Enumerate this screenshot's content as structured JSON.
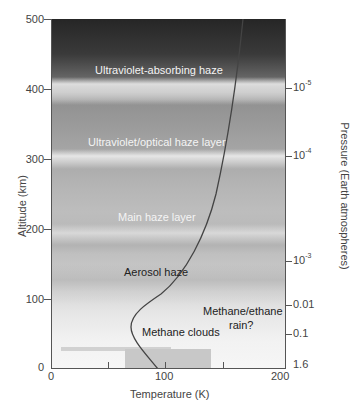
{
  "diagram": {
    "x_axis": {
      "label": "Temperature (K)",
      "ticks": [
        "0",
        "100",
        "200"
      ],
      "range": [
        0,
        200
      ]
    },
    "y_axis_left": {
      "label": "Altitude (km)",
      "ticks": [
        "0",
        "100",
        "200",
        "300",
        "400",
        "500"
      ],
      "range": [
        0,
        500
      ]
    },
    "y_axis_right": {
      "label": "Pressure (Earth atmospheres)",
      "ticks": [
        {
          "base": "10",
          "exp": "-5",
          "altitude_km": 400
        },
        {
          "base": "10",
          "exp": "-4",
          "altitude_km": 300
        },
        {
          "base": "10",
          "exp": "-3",
          "altitude_km": 150
        },
        {
          "text": "0.01",
          "altitude_km": 95
        },
        {
          "text": "0.1",
          "altitude_km": 45
        },
        {
          "text": "1.6",
          "altitude_km": 0
        }
      ]
    },
    "layers": [
      {
        "label": "Ultraviolet-absorbing haze",
        "altitude_km": 420
      },
      {
        "label": "Ultraviolet/optical haze layer",
        "altitude_km": 320
      },
      {
        "label": "Main haze layer",
        "altitude_km": 215
      },
      {
        "label": "Aerosol haze",
        "altitude_km": 140
      },
      {
        "label": "Methane clouds",
        "altitude_km": 50
      },
      {
        "label_line1": "Methane/ethane",
        "label_line2": "rain?",
        "altitude_km": 60
      }
    ],
    "temperature_profile": {
      "points_K_km": [
        [
          94,
          0
        ],
        [
          80,
          30
        ],
        [
          72,
          60
        ],
        [
          78,
          85
        ],
        [
          95,
          110
        ],
        [
          115,
          140
        ],
        [
          135,
          180
        ],
        [
          150,
          230
        ],
        [
          160,
          290
        ],
        [
          165,
          350
        ],
        [
          168,
          420
        ],
        [
          170,
          500
        ]
      ]
    },
    "colors": {
      "sky_top": "#262626",
      "sky_bottom": "#f6f6f6",
      "curve": "#444444",
      "text_light": "#f4f4f4",
      "text_dark": "#222222"
    }
  }
}
